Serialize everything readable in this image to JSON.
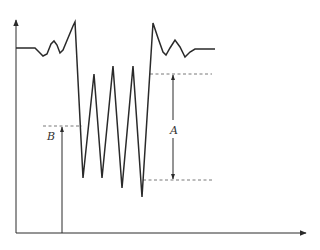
{
  "diagram": {
    "title": "",
    "colors": {
      "line": "#2a2a2a",
      "dashed": "#555555",
      "background": "#ffffff"
    },
    "labels": {
      "A": "A",
      "B": "B"
    },
    "axes": {
      "x_axis": {
        "from": [
          16,
          233
        ],
        "to": [
          306,
          233
        ],
        "arrow": true,
        "label": ""
      },
      "y_axis": {
        "from": [
          16,
          233
        ],
        "to": [
          16,
          20
        ],
        "arrow": true,
        "label": ""
      }
    },
    "waveform_points": "16,48 35,48 39,52 43,56 47,54 51,44 54,41 57,45 60,53 63,50 68,38 73,26 75,22 83,178 94,74 102,178 113,66 122,188 133,66 142,197 153,23 158,38 163,52 166,55 170,48 175,40 180,47 185,57 190,52 195,49 215,49",
    "dashed_lines": [
      {
        "name": "upper-reference",
        "x1": 150,
        "y1": 74,
        "x2": 212,
        "y2": 74
      },
      {
        "name": "lower-reference",
        "x1": 143,
        "y1": 180,
        "x2": 212,
        "y2": 180
      },
      {
        "name": "b-reference",
        "x1": 43,
        "y1": 126,
        "x2": 82,
        "y2": 126
      }
    ],
    "dimension_A": {
      "x": 173,
      "top": 74,
      "bottom": 180,
      "label_pos": [
        170,
        134
      ]
    },
    "dimension_B": {
      "x": 62,
      "top": 126,
      "bottom": 233,
      "label_pos": [
        47,
        140
      ]
    }
  }
}
